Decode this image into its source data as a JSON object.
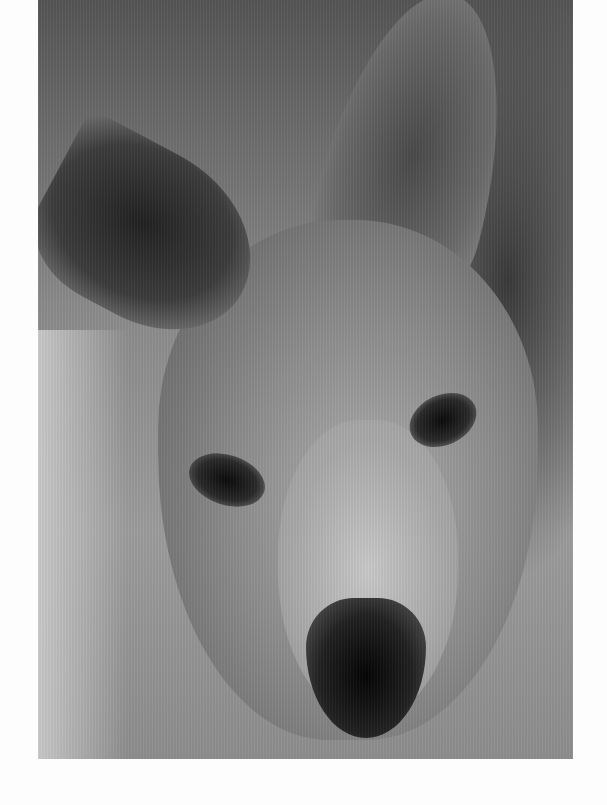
{
  "image": {
    "subject": "Close-up black-and-white photograph of a kangaroo's face",
    "style": "monochrome",
    "frame": {
      "left": 38,
      "top": 0,
      "width": 535,
      "height": 759
    },
    "background_color": "#fdfdfd"
  }
}
